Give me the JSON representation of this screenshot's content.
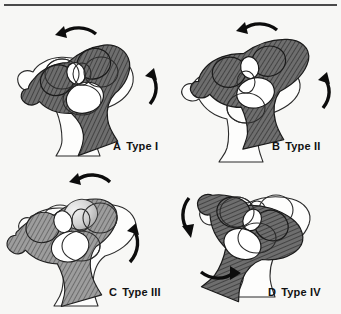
{
  "figure": {
    "background_color": "#f7f7f5",
    "rule_color": "#4a4a4a",
    "ink_color": "#111111"
  },
  "palette": {
    "outline_stroke": "#2b2b2b",
    "overlay_dark_fill": "#6e6e6e",
    "overlay_mid_fill": "#9a9a9a",
    "overlay_light_fill": "#cfcfcf",
    "hatch_stroke": "#3d3d3d",
    "white_fill": "#ffffff",
    "arrow_color": "#0c0c0c"
  },
  "panels": [
    {
      "id": "a",
      "letter": "A",
      "type_label": "Type I",
      "shading": "dark-hatched",
      "rotation_sense": "counterclockwise",
      "arrows": [
        {
          "name": "top-arrow",
          "direction": "left"
        },
        {
          "name": "right-arrow",
          "direction": "up"
        }
      ]
    },
    {
      "id": "b",
      "letter": "B",
      "type_label": "Type II",
      "shading": "dark-hatched",
      "rotation_sense": "counterclockwise",
      "arrows": [
        {
          "name": "top-arrow",
          "direction": "left"
        },
        {
          "name": "right-arrow",
          "direction": "up"
        }
      ]
    },
    {
      "id": "c",
      "letter": "C",
      "type_label": "Type III",
      "shading": "mixed-light",
      "rotation_sense": "counterclockwise",
      "arrows": [
        {
          "name": "top-arrow",
          "direction": "left"
        },
        {
          "name": "right-arrow",
          "direction": "up"
        }
      ]
    },
    {
      "id": "d",
      "letter": "D",
      "type_label": "Type IV",
      "shading": "dark-hatched",
      "rotation_sense": "clockwise",
      "arrows": [
        {
          "name": "left-arrow",
          "direction": "down"
        },
        {
          "name": "bottom-arrow",
          "direction": "right"
        }
      ]
    }
  ]
}
